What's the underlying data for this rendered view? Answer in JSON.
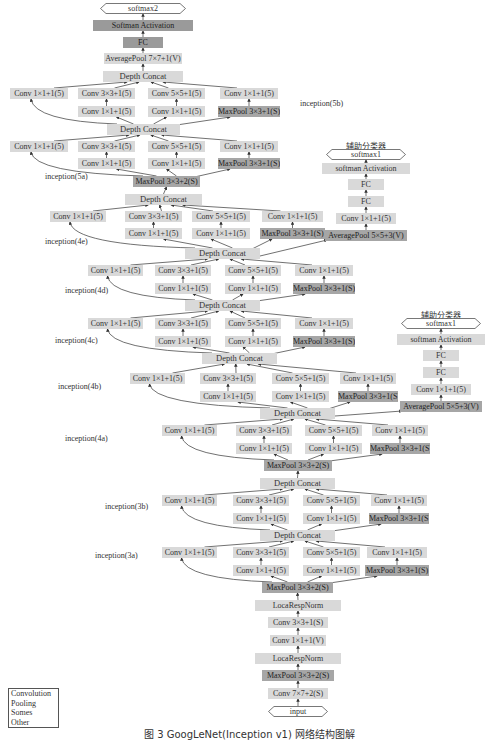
{
  "figure": {
    "caption": "图 3 GoogLeNet(Inception v1) 网络结构图解",
    "legend": [
      "Convolution",
      "Pooling",
      "Somes",
      "Other"
    ],
    "aux_label": "辅助分类器"
  },
  "main_stack": {
    "output": "softmax2",
    "softmax": "Softman Activation",
    "fc": "FC",
    "avgpool": "AveragePool 7×7+1(V)",
    "input": "input",
    "stem": {
      "lrn2": "LocaRespNorm",
      "conv3": "Conv 3×3+1(S)",
      "conv1v": "Conv 1×1+1(V)",
      "lrn1": "LocaRespNorm",
      "maxpool1": "MaxPool 3×3+2(S)",
      "conv7": "Conv 7×7+2(S)"
    }
  },
  "inception_labels": {
    "5b": "inception(5b)",
    "5a": "inception(5a)",
    "4e": "inception(4e)",
    "4d": "inception(4d)",
    "4c": "inception(4c)",
    "4b": "inception(4b)",
    "4a": "inception(4a)",
    "3b": "inception(3b)",
    "3a": "inception(3a)"
  },
  "blocks": {
    "depth_concat": "Depth Concat",
    "conv1": "Conv 1×1+1(5)",
    "conv3": "Conv 3×3+1(5)",
    "conv5": "Conv 5×5+1(5)",
    "conv1_reduce": "Conv 1×1+1(5)",
    "maxpool_branch": "MaxPool 3×3+1(S)",
    "maxpool_stride2": "MaxPool 3×3+2(S)"
  },
  "aux1": {
    "label": "辅助分类器",
    "output": "softmax1",
    "softmax": "softman Activation",
    "fc2": "FC",
    "fc1": "FC",
    "conv": "Conv 1×1+1(5)",
    "avgpool": "AveragePool 5×5+3(V)"
  },
  "aux2": {
    "label": "辅助分类器",
    "output": "softmax1",
    "softmax": "softman Activation",
    "fc2": "FC",
    "fc1": "FC",
    "conv": "Conv 1×1+1(5)",
    "avgpool": "AveragePool 5×5+3(V)"
  },
  "colors": {
    "conv": "#d9d9d9",
    "pool": "#a6a6a6",
    "edge": "#333333"
  }
}
